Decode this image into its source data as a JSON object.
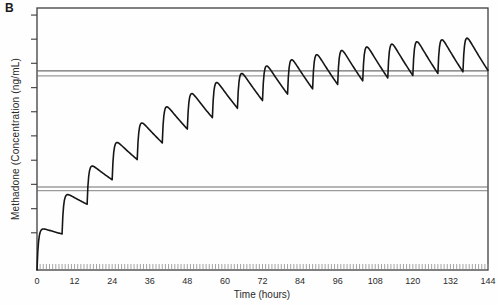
{
  "panel_label": "B",
  "chart_data": {
    "type": "line",
    "title": "",
    "xlabel": "Time (hours)",
    "ylabel": "Methadone (Concentration (ng/mL)",
    "xlim": [
      0,
      144
    ],
    "x_tick_interval_h": 12,
    "x_tick_labels": [
      "0",
      "12",
      "24",
      "36",
      "48",
      "60",
      "72",
      "84",
      "96",
      "108",
      "120",
      "132",
      "144"
    ],
    "x_minor_tick_interval_h": 1,
    "y_axis": {
      "labeled": false,
      "tick_count": 10,
      "tick_fracs": [
        0.142,
        0.234,
        0.327,
        0.419,
        0.512,
        0.604,
        0.696,
        0.789,
        0.881,
        0.973
      ]
    },
    "grid": false,
    "legend": false,
    "frame": "full-box",
    "series": [
      {
        "name": "methadone plasma concentration, repeated oral dosing to steady state",
        "line_style": "solid",
        "model": {
          "type": "one-compartment-first-order-absorption-superposition",
          "dose_interval_h": 8,
          "first_dose_h": 0,
          "num_doses": 18,
          "ka_per_h": 2.2,
          "ke_per_h": 0.024,
          "sample_step_h": 0.25,
          "steady_state_peak_axis_fraction": 0.885
        },
        "peak_heights_fraction_of_steady_state": [
          0.16,
          0.29,
          0.4,
          0.5,
          0.58,
          0.65,
          0.71,
          0.77,
          0.81,
          0.85,
          0.88,
          0.9,
          0.93,
          0.95,
          0.96,
          0.98,
          0.99,
          1.0
        ]
      }
    ],
    "reference_lines": [
      {
        "name": "upper-double-line",
        "axis_fractions": [
          0.76,
          0.741
        ]
      },
      {
        "name": "lower-double-line",
        "axis_fractions": [
          0.317,
          0.303
        ]
      }
    ],
    "colors": {
      "curve": "#161616",
      "axis_frame": "#3d3d3d",
      "reference_line_dark": "#6e6e6e",
      "reference_line_light": "#9a9a9a",
      "minor_ticks": "#9a9a9a",
      "background": "#fefefe"
    }
  }
}
